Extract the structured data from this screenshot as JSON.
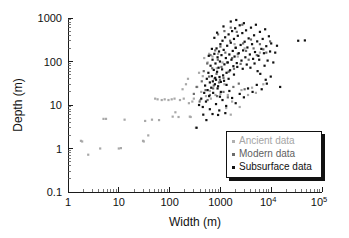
{
  "chart_data": {
    "type": "scatter",
    "title": "",
    "xlabel": "Width (m)",
    "ylabel": "Depth (m)",
    "xscale": "log",
    "yscale": "log",
    "xlim": [
      1,
      100000
    ],
    "ylim": [
      0.1,
      1000
    ],
    "grid": false,
    "legend_position": "lower-right",
    "xticks": [
      {
        "value": 1,
        "label": "1"
      },
      {
        "value": 10,
        "label": "10"
      },
      {
        "value": 100,
        "label": "100"
      },
      {
        "value": 1000,
        "label": "1000"
      },
      {
        "value": 10000,
        "label": "10",
        "sup": "4"
      },
      {
        "value": 100000,
        "label": "10",
        "sup": "5"
      }
    ],
    "yticks": [
      {
        "value": 1000,
        "label": "1000"
      },
      {
        "value": 100,
        "label": "100"
      },
      {
        "value": 10,
        "label": "10"
      },
      {
        "value": 1,
        "label": "1"
      },
      {
        "value": 0.1,
        "label": "0.1"
      }
    ],
    "series": [
      {
        "name": "Ancient data",
        "color": "#a8a8a8",
        "marker": "square",
        "points": [
          [
            1.8,
            1.5
          ],
          [
            1.9,
            1.45
          ],
          [
            2.5,
            0.72
          ],
          [
            4.3,
            1.0
          ],
          [
            5.0,
            4.8
          ],
          [
            5.6,
            4.8
          ],
          [
            10.0,
            1.0
          ],
          [
            11.0,
            1.02
          ],
          [
            13.0,
            4.6
          ],
          [
            30.0,
            1.5
          ],
          [
            31.0,
            1.45
          ],
          [
            33.0,
            4.3
          ],
          [
            38.0,
            2.0
          ],
          [
            45.0,
            4.6
          ],
          [
            52.0,
            14.0
          ],
          [
            58.0,
            13.5
          ],
          [
            62.0,
            4.5
          ],
          [
            70.0,
            13.0
          ],
          [
            80.0,
            13.5
          ],
          [
            95.0,
            13.0
          ],
          [
            110.0,
            13.5
          ],
          [
            115.0,
            5.4
          ],
          [
            125.0,
            14.0
          ],
          [
            130.0,
            6.8
          ],
          [
            150.0,
            5.3
          ],
          [
            160.0,
            13.0
          ],
          [
            180.0,
            23.0
          ],
          [
            190.0,
            14.0
          ],
          [
            210.0,
            30.0
          ],
          [
            230.0,
            40.0
          ],
          [
            240.0,
            11.0
          ],
          [
            250.0,
            5.4
          ],
          [
            260.0,
            5.3
          ],
          [
            280.0,
            12.0
          ],
          [
            300.0,
            14.0
          ],
          [
            330.0,
            3.0
          ],
          [
            350.0,
            26.0
          ],
          [
            380.0,
            55.0
          ],
          [
            400.0,
            13.0
          ],
          [
            420.0,
            20.0
          ],
          [
            450.0,
            46.0
          ],
          [
            480.0,
            120.0
          ],
          [
            520.0,
            16.0
          ],
          [
            560.0,
            95.0
          ],
          [
            600.0,
            150.0
          ],
          [
            620.0,
            21.0
          ],
          [
            650.0,
            14.0
          ],
          [
            700.0,
            130.0
          ],
          [
            750.0,
            40.0
          ],
          [
            800.0,
            17.0
          ],
          [
            850.0,
            70.0
          ],
          [
            900.0,
            150.0
          ],
          [
            1000.0,
            18.0
          ],
          [
            1100.0,
            95.0
          ],
          [
            1200.0,
            30.0
          ],
          [
            1400.0,
            17.0
          ],
          [
            1500.0,
            60.0
          ],
          [
            1700.0,
            12.0
          ],
          [
            1900.0,
            250.0
          ],
          [
            2200.0,
            130.0
          ],
          [
            2600.0,
            22.0
          ],
          [
            3000.0,
            200.0
          ],
          [
            3500.0,
            17.0
          ],
          [
            4200.0,
            25.0
          ],
          [
            5000.0,
            19.0
          ],
          [
            6000.0,
            160.0
          ],
          [
            7000.0,
            30.0
          ],
          [
            1600.0,
            6.0
          ],
          [
            2400.0,
            9.0
          ],
          [
            1300.0,
            8.5
          ]
        ]
      },
      {
        "name": "Modern data",
        "color": "#6b6b6b",
        "marker": "square",
        "points": [
          [
            300.0,
            18.0
          ],
          [
            340.0,
            26.0
          ],
          [
            390.0,
            12.0
          ],
          [
            430.0,
            35.0
          ],
          [
            470.0,
            60.0
          ],
          [
            510.0,
            22.0
          ],
          [
            550.0,
            90.0
          ],
          [
            600.0,
            45.0
          ],
          [
            640.0,
            140.0
          ],
          [
            690.0,
            70.0
          ],
          [
            740.0,
            28.0
          ],
          [
            790.0,
            180.0
          ],
          [
            840.0,
            52.0
          ],
          [
            890.0,
            110.0
          ],
          [
            940.0,
            33.0
          ],
          [
            1000.0,
            220.0
          ],
          [
            1050.0,
            75.0
          ],
          [
            1150.0,
            42.0
          ],
          [
            1250.0,
            160.0
          ],
          [
            1350.0,
            95.0
          ],
          [
            1450.0,
            58.0
          ],
          [
            1550.0,
            300.0
          ],
          [
            1700.0,
            120.0
          ],
          [
            1850.0,
            68.0
          ],
          [
            2000.0,
            210.0
          ],
          [
            2200.0,
            150.0
          ],
          [
            2500.0,
            88.0
          ],
          [
            2800.0,
            260.0
          ],
          [
            3200.0,
            175.0
          ],
          [
            3600.0,
            110.0
          ],
          [
            4000.0,
            320.0
          ],
          [
            4500.0,
            200.0
          ],
          [
            5200.0,
            140.0
          ],
          [
            6000.0,
            250.0
          ],
          [
            7000.0,
            190.0
          ],
          [
            8000.0,
            160.0
          ],
          [
            9500.0,
            290.0
          ],
          [
            560.0,
            13.0
          ],
          [
            620.0,
            17.0
          ],
          [
            720.0,
            24.0
          ],
          [
            860.0,
            16.0
          ],
          [
            980.0,
            38.0
          ],
          [
            1150.0,
            20.0
          ],
          [
            1400.0,
            15.0
          ],
          [
            1800.0,
            26.0
          ],
          [
            2300.0,
            31.0
          ],
          [
            3000.0,
            23.0
          ],
          [
            900.0,
            420.0
          ],
          [
            1200.0,
            500.0
          ],
          [
            1600.0,
            600.0
          ],
          [
            2100.0,
            480.0
          ],
          [
            2700.0,
            700.0
          ]
        ]
      },
      {
        "name": "Subsurface data",
        "color": "#111111",
        "marker": "square",
        "points": [
          [
            380.0,
            10.0
          ],
          [
            420.0,
            14.0
          ],
          [
            450.0,
            9.0
          ],
          [
            480.0,
            19.0
          ],
          [
            500.0,
            28.0
          ],
          [
            520.0,
            12.0
          ],
          [
            540.0,
            40.0
          ],
          [
            560.0,
            22.0
          ],
          [
            580.0,
            55.0
          ],
          [
            600.0,
            16.0
          ],
          [
            620.0,
            33.0
          ],
          [
            640.0,
            80.0
          ],
          [
            660.0,
            25.0
          ],
          [
            680.0,
            46.0
          ],
          [
            700.0,
            110.0
          ],
          [
            720.0,
            19.0
          ],
          [
            740.0,
            64.0
          ],
          [
            760.0,
            150.0
          ],
          [
            780.0,
            30.0
          ],
          [
            800.0,
            90.0
          ],
          [
            820.0,
            38.0
          ],
          [
            840.0,
            200.0
          ],
          [
            860.0,
            58.0
          ],
          [
            880.0,
            125.0
          ],
          [
            900.0,
            27.0
          ],
          [
            920.0,
            72.0
          ],
          [
            940.0,
            170.0
          ],
          [
            960.0,
            44.0
          ],
          [
            980.0,
            100.0
          ],
          [
            1000.0,
            250.0
          ],
          [
            1020.0,
            34.0
          ],
          [
            1050.0,
            140.0
          ],
          [
            1080.0,
            66.0
          ],
          [
            1100.0,
            300.0
          ],
          [
            1130.0,
            48.0
          ],
          [
            1160.0,
            185.0
          ],
          [
            1200.0,
            86.0
          ],
          [
            1240.0,
            360.0
          ],
          [
            1280.0,
            120.0
          ],
          [
            1320.0,
            55.0
          ],
          [
            1360.0,
            230.0
          ],
          [
            1400.0,
            95.0
          ],
          [
            1450.0,
            420.0
          ],
          [
            1500.0,
            145.0
          ],
          [
            1550.0,
            63.0
          ],
          [
            1600.0,
            270.0
          ],
          [
            1650.0,
            110.0
          ],
          [
            1700.0,
            500.0
          ],
          [
            1750.0,
            175.0
          ],
          [
            1800.0,
            78.0
          ],
          [
            1850.0,
            330.0
          ],
          [
            1900.0,
            130.0
          ],
          [
            1950.0,
            580.0
          ],
          [
            2000.0,
            205.0
          ],
          [
            2100.0,
            92.0
          ],
          [
            2200.0,
            390.0
          ],
          [
            2300.0,
            155.0
          ],
          [
            2400.0,
            680.0
          ],
          [
            2500.0,
            240.0
          ],
          [
            2600.0,
            105.0
          ],
          [
            2700.0,
            450.0
          ],
          [
            2800.0,
            180.0
          ],
          [
            2900.0,
            760.0
          ],
          [
            3000.0,
            285.0
          ],
          [
            3100.0,
            125.0
          ],
          [
            3200.0,
            520.0
          ],
          [
            3400.0,
            210.0
          ],
          [
            3600.0,
            340.0
          ],
          [
            3800.0,
            145.0
          ],
          [
            4000.0,
            600.0
          ],
          [
            4200.0,
            250.0
          ],
          [
            4400.0,
            115.0
          ],
          [
            4600.0,
            400.0
          ],
          [
            4800.0,
            165.0
          ],
          [
            5000.0,
            700.0
          ],
          [
            5300.0,
            290.0
          ],
          [
            5600.0,
            135.0
          ],
          [
            6000.0,
            480.0
          ],
          [
            6400.0,
            195.0
          ],
          [
            6800.0,
            330.0
          ],
          [
            7200.0,
            155.0
          ],
          [
            7600.0,
            550.0
          ],
          [
            8000.0,
            225.0
          ],
          [
            8500.0,
            105.0
          ],
          [
            9000.0,
            380.0
          ],
          [
            9500.0,
            170.0
          ],
          [
            10000.0,
            260.0
          ],
          [
            620.0,
            8.0
          ],
          [
            700.0,
            6.2
          ],
          [
            820.0,
            10.5
          ],
          [
            950.0,
            7.5
          ],
          [
            1100.0,
            13.0
          ],
          [
            1300.0,
            9.5
          ],
          [
            1500.0,
            21.0
          ],
          [
            1700.0,
            14.5
          ],
          [
            2000.0,
            11.0
          ],
          [
            2400.0,
            18.0
          ],
          [
            2900.0,
            15.0
          ],
          [
            3500.0,
            24.0
          ],
          [
            4300.0,
            20.0
          ],
          [
            5200.0,
            29.0
          ],
          [
            6500.0,
            23.0
          ],
          [
            8200.0,
            31.0
          ],
          [
            460.0,
            6.0
          ],
          [
            530.0,
            4.5
          ],
          [
            340.0,
            3.0
          ],
          [
            900.0,
            5.9
          ],
          [
            1250.0,
            6.5
          ],
          [
            1600.0,
            830.0
          ],
          [
            2050.0,
            900.0
          ],
          [
            1150.0,
            640.0
          ],
          [
            860.0,
            460.0
          ],
          [
            760.0,
            350.0
          ],
          [
            680.0,
            195.0
          ],
          [
            590.0,
            135.0
          ],
          [
            34000.0,
            300.0
          ],
          [
            46000.0,
            305.0
          ],
          [
            12000.0,
            160.0
          ],
          [
            11000.0,
            95.0
          ],
          [
            13000.0,
            230.0
          ],
          [
            15000.0,
            26.0
          ],
          [
            9800.0,
            45.0
          ],
          [
            7800.0,
            38.0
          ],
          [
            6100.0,
            52.0
          ],
          [
            5400.0,
            60.0
          ],
          [
            1450.0,
            40.0
          ],
          [
            1320.0,
            29.0
          ],
          [
            1180.0,
            36.0
          ],
          [
            1020.0,
            20.0
          ],
          [
            980.0,
            15.5
          ],
          [
            880.0,
            24.0
          ],
          [
            790.0,
            42.0
          ],
          [
            710.0,
            35.0
          ],
          [
            3300.0,
            85.0
          ],
          [
            2750.0,
            68.0
          ],
          [
            2150.0,
            75.0
          ],
          [
            1850.0,
            50.0
          ],
          [
            4700.0,
            90.0
          ],
          [
            3900.0,
            72.0
          ],
          [
            5800.0,
            110.0
          ],
          [
            7400.0,
            80.0
          ]
        ]
      }
    ]
  },
  "legend": {
    "items": [
      {
        "label": "Ancient data",
        "color": "#a8a8a8"
      },
      {
        "label": "Modern data",
        "color": "#6b6b6b"
      },
      {
        "label": "Subsurface data",
        "color": "#111111"
      }
    ]
  }
}
